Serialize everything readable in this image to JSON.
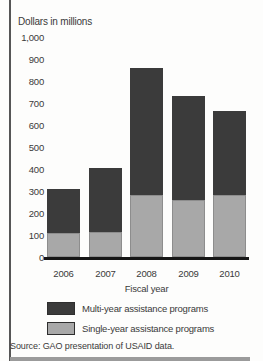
{
  "figure": {
    "y_axis_title": "Dollars in millions",
    "x_axis_title": "Fiscal year",
    "source_note": "Source: GAO presentation of USAID data."
  },
  "chart_data": {
    "type": "bar",
    "stacked": true,
    "title": "Dollars in millions",
    "xlabel": "Fiscal year",
    "ylabel": "Dollars in millions",
    "ylim": [
      0,
      1000
    ],
    "ytick_labels": [
      "1,000",
      "900",
      "800",
      "700",
      "600",
      "500",
      "400",
      "300",
      "200",
      "100",
      "0"
    ],
    "ytick_values": [
      1000,
      900,
      800,
      700,
      600,
      500,
      400,
      300,
      200,
      100,
      0
    ],
    "categories": [
      "2006",
      "2007",
      "2008",
      "2009",
      "2010"
    ],
    "series": [
      {
        "name": "Single-year assistance programs",
        "color": "#a8a8a8",
        "values": [
          110,
          115,
          280,
          260,
          280
        ]
      },
      {
        "name": "Multi-year assistance programs",
        "color": "#3b3b3b",
        "values": [
          200,
          290,
          580,
          470,
          385
        ]
      }
    ],
    "totals": [
      310,
      405,
      860,
      730,
      665
    ],
    "grid": false,
    "legend_position": "bottom",
    "legend": [
      {
        "label": "Multi-year assistance programs",
        "color": "#3b3b3b"
      },
      {
        "label": "Single-year assistance programs",
        "color": "#a8a8a8"
      }
    ],
    "axis_color": "#161616"
  }
}
